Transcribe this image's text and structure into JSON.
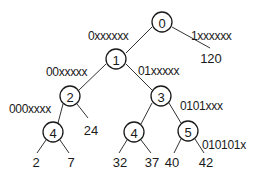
{
  "diagram": {
    "type": "binary-trie",
    "nodes": [
      {
        "id": "n0",
        "label": "0",
        "x": 162,
        "y": 22
      },
      {
        "id": "n1",
        "label": "1",
        "x": 116,
        "y": 59
      },
      {
        "id": "n2",
        "label": "2",
        "x": 70,
        "y": 96
      },
      {
        "id": "n3",
        "label": "3",
        "x": 161,
        "y": 96
      },
      {
        "id": "n4a",
        "label": "4",
        "x": 53,
        "y": 132
      },
      {
        "id": "n4b",
        "label": "4",
        "x": 134,
        "y": 132
      },
      {
        "id": "n5",
        "label": "5",
        "x": 188,
        "y": 131
      }
    ],
    "leaves": [
      {
        "id": "l120",
        "label": "120",
        "x": 211,
        "y": 63
      },
      {
        "id": "l24",
        "label": "24",
        "x": 91,
        "y": 135
      },
      {
        "id": "l2",
        "label": "2",
        "x": 36,
        "y": 167
      },
      {
        "id": "l7",
        "label": "7",
        "x": 71,
        "y": 167
      },
      {
        "id": "l32",
        "label": "32",
        "x": 120,
        "y": 167
      },
      {
        "id": "l37",
        "label": "37",
        "x": 152,
        "y": 167
      },
      {
        "id": "l40",
        "label": "40",
        "x": 172,
        "y": 167
      },
      {
        "id": "l42",
        "label": "42",
        "x": 206,
        "y": 167
      }
    ],
    "edges": [
      {
        "from": "n0",
        "to": "n1",
        "x1": 152,
        "y1": 27,
        "x2": 126,
        "y2": 53
      },
      {
        "from": "n0",
        "to": "l120",
        "x1": 172,
        "y1": 27,
        "x2": 210,
        "y2": 48
      },
      {
        "from": "n1",
        "to": "n2",
        "x1": 106,
        "y1": 64,
        "x2": 79,
        "y2": 90
      },
      {
        "from": "n1",
        "to": "n3",
        "x1": 126,
        "y1": 64,
        "x2": 152,
        "y2": 90
      },
      {
        "from": "n2",
        "to": "n4a",
        "x1": 63,
        "y1": 104,
        "x2": 58,
        "y2": 123
      },
      {
        "from": "n2",
        "to": "l24",
        "x1": 77,
        "y1": 104,
        "x2": 88,
        "y2": 118
      },
      {
        "from": "n3",
        "to": "n4b",
        "x1": 152,
        "y1": 103,
        "x2": 141,
        "y2": 124
      },
      {
        "from": "n3",
        "to": "n5",
        "x1": 169,
        "y1": 103,
        "x2": 181,
        "y2": 123
      },
      {
        "from": "n4a",
        "to": "l2",
        "x1": 46,
        "y1": 140,
        "x2": 37,
        "y2": 153
      },
      {
        "from": "n4a",
        "to": "l7",
        "x1": 60,
        "y1": 140,
        "x2": 69,
        "y2": 153
      },
      {
        "from": "n4b",
        "to": "l32",
        "x1": 127,
        "y1": 140,
        "x2": 119,
        "y2": 153
      },
      {
        "from": "n4b",
        "to": "l37",
        "x1": 141,
        "y1": 140,
        "x2": 151,
        "y2": 153
      },
      {
        "from": "n5",
        "to": "l40",
        "x1": 181,
        "y1": 139,
        "x2": 174,
        "y2": 153
      },
      {
        "from": "n5",
        "to": "l42",
        "x1": 195,
        "y1": 139,
        "x2": 204,
        "y2": 153
      }
    ],
    "edge_labels": [
      {
        "id": "e0xxxxxx",
        "text": "0xxxxxx",
        "x": 88,
        "y": 40
      },
      {
        "id": "e1xxxxxx",
        "text": "1xxxxxx",
        "x": 191,
        "y": 40
      },
      {
        "id": "e00xxxxx",
        "text": "00xxxxx",
        "x": 46,
        "y": 76
      },
      {
        "id": "e01xxxxx",
        "text": "01xxxxx",
        "x": 138,
        "y": 75
      },
      {
        "id": "e000xxxx",
        "text": "000xxxx",
        "x": 9,
        "y": 113
      },
      {
        "id": "e0101xxx",
        "text": "0101xxx",
        "x": 180,
        "y": 110
      },
      {
        "id": "e010101x",
        "text": "010101x",
        "x": 202,
        "y": 149
      }
    ]
  },
  "colors": {
    "line": "#333333",
    "text": "#1a1a1a",
    "background": "#ffffff"
  }
}
